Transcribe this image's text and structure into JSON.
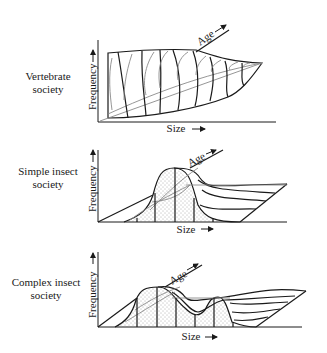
{
  "panels": [
    {
      "label_line1": "Vertebrate",
      "label_line2": "society",
      "y_axis_label": "Frequency",
      "x_axis_label": "Size",
      "depth_axis_label": "Age",
      "arrow_glyph": "→"
    },
    {
      "label_line1": "Simple insect",
      "label_line2": "society",
      "y_axis_label": "Frequency",
      "x_axis_label": "Size",
      "depth_axis_label": "Age",
      "arrow_glyph": "→"
    },
    {
      "label_line1": "Complex insect",
      "label_line2": "society",
      "y_axis_label": "Frequency",
      "x_axis_label": "Size",
      "depth_axis_label": "Age",
      "arrow_glyph": "→"
    }
  ],
  "colors": {
    "ink": "#1a1a1a",
    "secondary_ink": "#8a8a8a",
    "stipple": "#555555",
    "background": "#ffffff"
  }
}
